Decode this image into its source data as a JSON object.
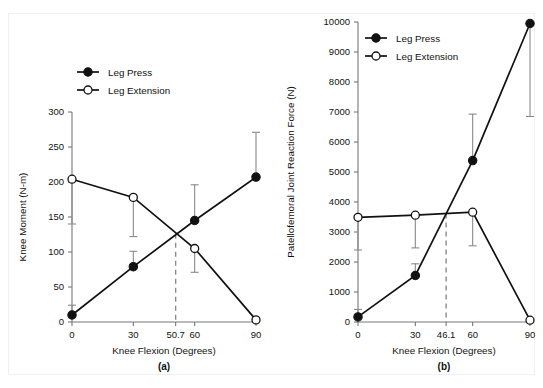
{
  "figure": {
    "background": "#ffffff",
    "ink": "#111111",
    "axis_color": "#777777",
    "errbar_color": "#8a8a8a",
    "dashed_color": "#8a8a8a"
  },
  "legend": {
    "entries": [
      {
        "label": "Leg Press",
        "marker": "filled-circle-marker"
      },
      {
        "label": "Leg Extension",
        "marker": "open-circle-marker"
      }
    ]
  },
  "chart_data": [
    {
      "id": "panel-a",
      "type": "line",
      "panel_label": "(a)",
      "title": "",
      "xlabel": "Knee Flexion (Degrees)",
      "ylabel": "Knee Moment (N-m)",
      "xlim": [
        0,
        90
      ],
      "ylim": [
        0,
        300
      ],
      "yticks": [
        0,
        50,
        100,
        150,
        200,
        250,
        300
      ],
      "ytick_labels": [
        "0",
        "50",
        "100",
        "150",
        "200",
        "250",
        "300"
      ],
      "xticks": [
        0,
        30,
        50.7,
        60,
        90
      ],
      "xtick_labels": [
        "0",
        "30",
        "50.7",
        "60",
        "90"
      ],
      "grid": false,
      "legend_position": "top-center",
      "x": [
        0,
        30,
        60,
        90
      ],
      "series": [
        {
          "name": "Leg Press",
          "marker": "filled-circle-marker",
          "values": [
            10,
            79,
            145,
            207
          ],
          "err_upper": [
            24,
            101,
            196,
            271
          ],
          "err_lower": [
            null,
            null,
            null,
            null
          ]
        },
        {
          "name": "Leg Extension",
          "marker": "open-circle-marker",
          "values": [
            204,
            178,
            105,
            3
          ],
          "err_upper": [
            null,
            null,
            null,
            null
          ],
          "err_lower": [
            140,
            122,
            71,
            null
          ]
        }
      ],
      "crossover": {
        "x": 50.7,
        "y": 126,
        "label": "50.7"
      }
    },
    {
      "id": "panel-b",
      "type": "line",
      "panel_label": "(b)",
      "title": "",
      "xlabel": "Knee Flexion (Degrees)",
      "ylabel": "Patellofemoral Joint Reaction Force (N)",
      "xlim": [
        0,
        90
      ],
      "ylim": [
        0,
        10000
      ],
      "yticks": [
        0,
        1000,
        2000,
        3000,
        4000,
        5000,
        6000,
        7000,
        8000,
        9000,
        10000
      ],
      "ytick_labels": [
        "0",
        "1000",
        "2000",
        "3000",
        "4000",
        "5000",
        "6000",
        "7000",
        "8000",
        "9000",
        "10000"
      ],
      "xticks": [
        0,
        30,
        46.1,
        60,
        90
      ],
      "xtick_labels": [
        "0",
        "30",
        "46.1",
        "60",
        "90"
      ],
      "grid": false,
      "legend_position": "top-center",
      "x": [
        0,
        30,
        60,
        90
      ],
      "series": [
        {
          "name": "Leg Press",
          "marker": "filled-circle-marker",
          "values": [
            170,
            1550,
            5380,
            9950
          ],
          "err_upper": [
            420,
            1940,
            6930,
            null
          ],
          "err_lower": [
            null,
            null,
            null,
            6850
          ]
        },
        {
          "name": "Leg Extension",
          "marker": "open-circle-marker",
          "values": [
            3490,
            3560,
            3660,
            60
          ],
          "err_upper": [
            null,
            null,
            null,
            null
          ],
          "err_lower": [
            2400,
            2470,
            2540,
            null
          ]
        }
      ],
      "crossover": {
        "x": 46.1,
        "y": 3620,
        "label": "46.1"
      }
    }
  ]
}
